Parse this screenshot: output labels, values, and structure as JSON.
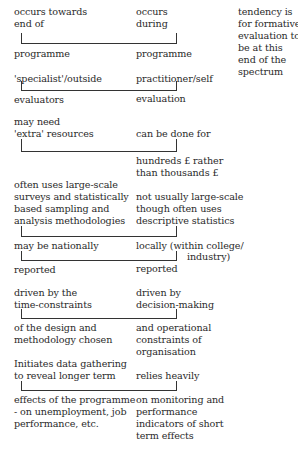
{
  "note": [
    "tendency is",
    "for formative",
    "evaluation to",
    "be at this",
    "end of the",
    "spectrum"
  ],
  "rows": [
    {
      "left_above": [
        "occurs towards",
        "end of"
      ],
      "right_above": [
        "occurs",
        "during"
      ],
      "left_below": [
        "programme"
      ],
      "right_below": [
        "programme"
      ]
    },
    {
      "left_above": [
        "'specialist'/outside"
      ],
      "right_above": [
        "practitioner/self"
      ],
      "left_below": [
        "evaluators"
      ],
      "right_below": [
        "evaluation"
      ]
    },
    {
      "left_above": [
        "may need",
        "'extra' resources"
      ],
      "right_above": [
        "can be done for"
      ],
      "left_below": [],
      "right_below": [
        "hundreds £ rather",
        "than thousands £"
      ]
    },
    {
      "left_above": [
        "often uses large-scale",
        "surveys and statistically",
        "based sampling and",
        "analysis methodologies"
      ],
      "right_above": [
        "not usually large-scale",
        "though often uses",
        "descriptive statistics"
      ],
      "left_below": [],
      "right_below": []
    },
    {
      "left_above": [
        "may be nationally"
      ],
      "right_above": [
        "locally (within college/",
        "industry)"
      ],
      "left_below": [
        "reported"
      ],
      "right_below": [
        "reported"
      ]
    },
    {
      "left_above": [
        "driven by the",
        "time-constraints"
      ],
      "right_above": [
        "driven by",
        "decision-making"
      ],
      "left_below": [
        "of the design and",
        "methodology chosen"
      ],
      "right_below": [
        "and operational",
        "constraints of",
        "organisation"
      ]
    },
    {
      "left_above": [
        "Initiates data gathering",
        "to reveal longer term"
      ],
      "right_above": [
        "relies heavily"
      ],
      "left_below": [
        "effects of the programme",
        "- on unemployment, job",
        "performance, etc."
      ],
      "right_below": [
        "on monitoring and",
        "performance",
        "indicators of short",
        "term effects"
      ]
    }
  ]
}
